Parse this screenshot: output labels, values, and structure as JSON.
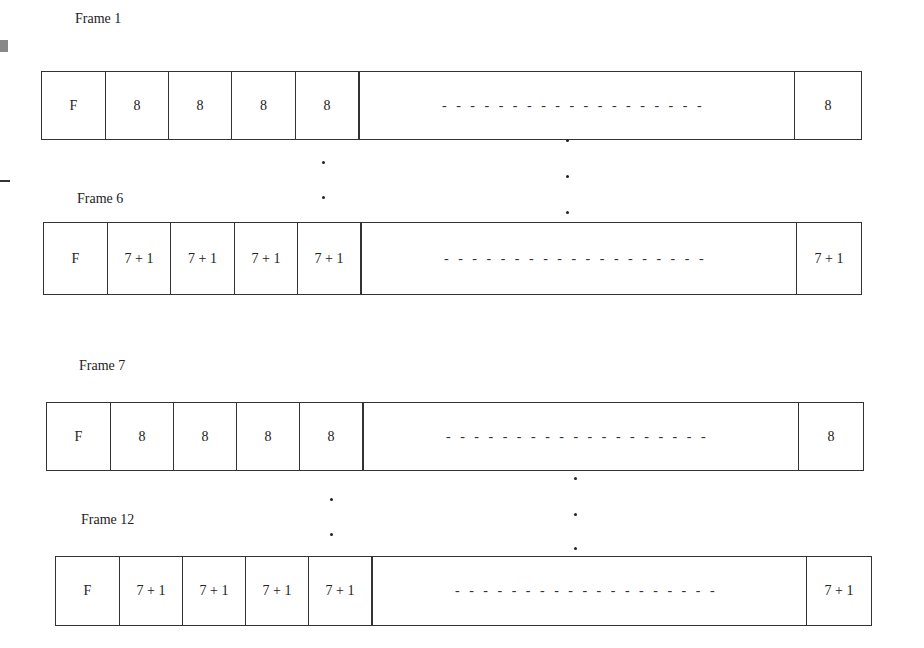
{
  "diagram": {
    "type": "frame-structure",
    "frames": [
      {
        "label": "Frame 1",
        "first_cell": "F",
        "cells": [
          "8",
          "8",
          "8",
          "8"
        ],
        "continuation": "- - - - - - - - - - - - - - - - - - -",
        "last_cell": "8"
      },
      {
        "label": "Frame 6",
        "first_cell": "F",
        "cells": [
          "7 + 1",
          "7 + 1",
          "7 + 1",
          "7 + 1"
        ],
        "continuation": "- - - - - - - - - - - - - - - - - - -",
        "last_cell": "7 + 1"
      },
      {
        "label": "Frame 7",
        "first_cell": "F",
        "cells": [
          "8",
          "8",
          "8",
          "8"
        ],
        "continuation": "- - - - - - - - - - - - - - - - - - -",
        "last_cell": "8"
      },
      {
        "label": "Frame 12",
        "first_cell": "F",
        "cells": [
          "7 + 1",
          "7 + 1",
          "7 + 1",
          "7 + 1"
        ],
        "continuation": "- - - - - - - - - - - - - - - - - - -",
        "last_cell": "7 + 1"
      }
    ],
    "ellipsis": "vertical dots indicating omitted frames 2-5 and 8-11"
  }
}
